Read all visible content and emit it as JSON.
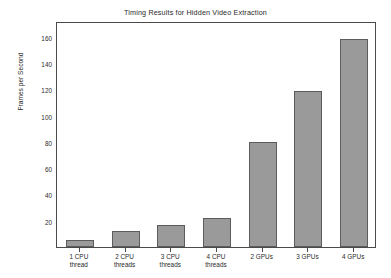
{
  "chart_data": {
    "type": "bar",
    "title": "Timing Results for Hidden Video Extraction",
    "xlabel": "",
    "ylabel": "Frames per Second",
    "categories": [
      "1 CPU\nthread",
      "2 CPU\nthreads",
      "3 CPU\nthreads",
      "4 CPU\nthreads",
      "2 GPUs",
      "3 GPUs",
      "4 GPUs"
    ],
    "values": [
      5,
      12,
      17,
      22,
      80,
      119,
      158
    ],
    "ylim": [
      0,
      172
    ],
    "yticks": [
      20,
      40,
      60,
      80,
      100,
      120,
      140,
      160
    ],
    "ytick_labels": [
      "20",
      "40",
      "60",
      "80",
      "100",
      "120",
      "140",
      "160"
    ],
    "grid": false,
    "legend": null,
    "bar_color": "#9a9a9a",
    "bar_edge_color": "#5c5c5c",
    "background_color": "#ffffff",
    "axis_color": "#4a4a4a"
  }
}
